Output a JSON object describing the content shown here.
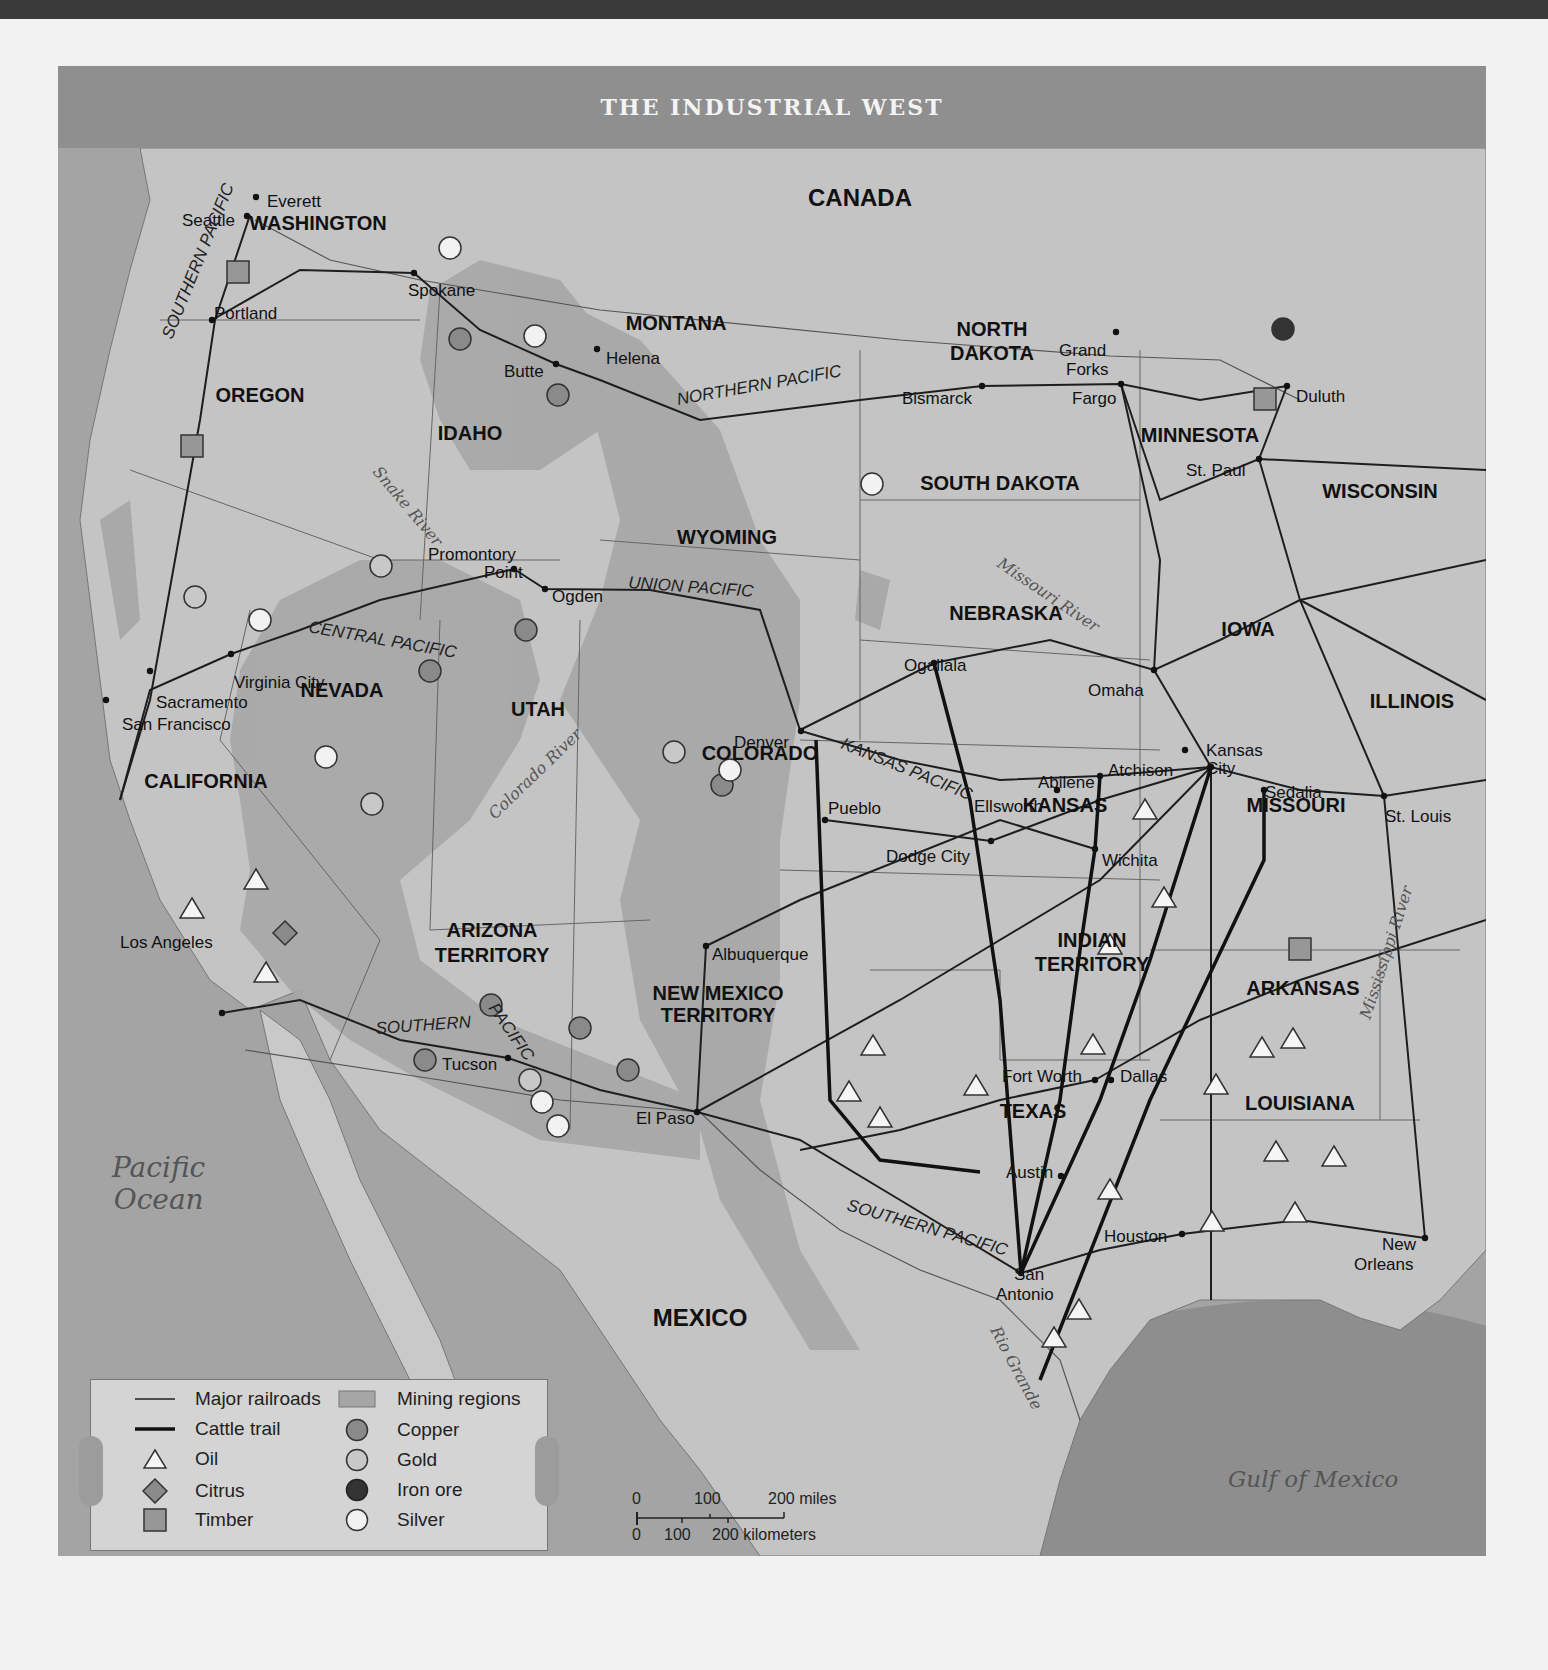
{
  "map": {
    "title": "THE INDUSTRIAL WEST",
    "countries": [
      "CANADA",
      "MEXICO"
    ],
    "water_bodies": [
      "Pacific Ocean",
      "Gulf of Mexico"
    ],
    "states": [
      {
        "name": "WASHINGTON",
        "x": 318,
        "y": 230
      },
      {
        "name": "OREGON",
        "x": 260,
        "y": 402
      },
      {
        "name": "CALIFORNIA",
        "x": 206,
        "y": 788
      },
      {
        "name": "IDAHO",
        "x": 470,
        "y": 440
      },
      {
        "name": "NEVADA",
        "x": 342,
        "y": 697
      },
      {
        "name": "UTAH",
        "x": 538,
        "y": 716
      },
      {
        "name": "ARIZONA",
        "x": 492,
        "y": 937
      },
      {
        "name": "TERRITORY",
        "x": 492,
        "y": 962
      },
      {
        "name": "MONTANA",
        "x": 676,
        "y": 330
      },
      {
        "name": "WYOMING",
        "x": 727,
        "y": 544
      },
      {
        "name": "COLORADO",
        "x": 760,
        "y": 760
      },
      {
        "name": "NEW MEXICO",
        "x": 718,
        "y": 1000
      },
      {
        "name": "TERRITORY",
        "x": 718,
        "y": 1022
      },
      {
        "name": "NORTH",
        "x": 992,
        "y": 336
      },
      {
        "name": "DAKOTA",
        "x": 992,
        "y": 360
      },
      {
        "name": "SOUTH DAKOTA",
        "x": 1000,
        "y": 490
      },
      {
        "name": "NEBRASKA",
        "x": 1006,
        "y": 620
      },
      {
        "name": "KANSAS",
        "x": 1065,
        "y": 812
      },
      {
        "name": "INDIAN",
        "x": 1092,
        "y": 947
      },
      {
        "name": "TERRITORY",
        "x": 1092,
        "y": 971
      },
      {
        "name": "TEXAS",
        "x": 1033,
        "y": 1118
      },
      {
        "name": "MINNESOTA",
        "x": 1200,
        "y": 442
      },
      {
        "name": "WISCONSIN",
        "x": 1380,
        "y": 498
      },
      {
        "name": "IOWA",
        "x": 1248,
        "y": 636
      },
      {
        "name": "ILLINOIS",
        "x": 1412,
        "y": 708
      },
      {
        "name": "MISSOURI",
        "x": 1296,
        "y": 812
      },
      {
        "name": "ARKANSAS",
        "x": 1303,
        "y": 995
      },
      {
        "name": "LOUISIANA",
        "x": 1300,
        "y": 1110
      },
      {
        "name": "CANADA",
        "x": 860,
        "y": 206
      },
      {
        "name": "MEXICO",
        "x": 700,
        "y": 1326
      }
    ],
    "cities": [
      {
        "name": "Seattle",
        "lx": 182,
        "ly": 212,
        "dx": 247,
        "dy": 216
      },
      {
        "name": "Everett",
        "lx": 267,
        "ly": 193,
        "dx": 256,
        "dy": 197
      },
      {
        "name": "Portland",
        "lx": 214,
        "ly": 305,
        "dx": 212,
        "dy": 320
      },
      {
        "name": "Spokane",
        "lx": 408,
        "ly": 282,
        "dx": 414,
        "dy": 273
      },
      {
        "name": "Butte",
        "lx": 504,
        "ly": 363,
        "dx": 556,
        "dy": 364
      },
      {
        "name": "Helena",
        "lx": 606,
        "ly": 350,
        "dx": 597,
        "dy": 349
      },
      {
        "name": "Bismarck",
        "lx": 902,
        "ly": 390,
        "dx": 982,
        "dy": 386
      },
      {
        "name": "Grand",
        "lx": 1059,
        "ly": 342,
        "dx": 1116,
        "dy": 332
      },
      {
        "name": "Forks",
        "lx": 1066,
        "ly": 361,
        "dx": -1,
        "dy": -1
      },
      {
        "name": "Fargo",
        "lx": 1072,
        "ly": 390,
        "dx": 1121,
        "dy": 384
      },
      {
        "name": "Duluth",
        "lx": 1296,
        "ly": 388,
        "dx": 1287,
        "dy": 386
      },
      {
        "name": "St. Paul",
        "lx": 1186,
        "ly": 462,
        "dx": 1259,
        "dy": 459
      },
      {
        "name": "Promontory",
        "lx": 428,
        "ly": 546,
        "dx": -1,
        "dy": -1
      },
      {
        "name": "Point",
        "lx": 484,
        "ly": 564,
        "dx": 514,
        "dy": 569
      },
      {
        "name": "Ogden",
        "lx": 552,
        "ly": 588,
        "dx": 545,
        "dy": 589
      },
      {
        "name": "Virginia City",
        "lx": 234,
        "ly": 674,
        "dx": 231,
        "dy": 654
      },
      {
        "name": "Sacramento",
        "lx": 156,
        "ly": 694,
        "dx": 150,
        "dy": 671
      },
      {
        "name": "San Francisco",
        "lx": 122,
        "ly": 716,
        "dx": 106,
        "dy": 700
      },
      {
        "name": "Ogallala",
        "lx": 904,
        "ly": 657,
        "dx": 934,
        "dy": 663
      },
      {
        "name": "Omaha",
        "lx": 1088,
        "ly": 682,
        "dx": 1154,
        "dy": 670
      },
      {
        "name": "Denver",
        "lx": 734,
        "ly": 734,
        "dx": 801,
        "dy": 731
      },
      {
        "name": "Kansas",
        "lx": 1206,
        "ly": 742,
        "dx": -1,
        "dy": -1
      },
      {
        "name": "City",
        "lx": 1206,
        "ly": 760,
        "dx": 1211,
        "dy": 767
      },
      {
        "name": "Atchison",
        "lx": 1108,
        "ly": 762,
        "dx": 1185,
        "dy": 750
      },
      {
        "name": "Abilene",
        "lx": 1038,
        "ly": 774,
        "dx": 1100,
        "dy": 776
      },
      {
        "name": "Ellsworth",
        "lx": 974,
        "ly": 798,
        "dx": 1057,
        "dy": 790
      },
      {
        "name": "Sedalia",
        "lx": 1265,
        "ly": 784,
        "dx": 1264,
        "dy": 790
      },
      {
        "name": "St. Louis",
        "lx": 1385,
        "ly": 808,
        "dx": 1384,
        "dy": 796
      },
      {
        "name": "Pueblo",
        "lx": 828,
        "ly": 800,
        "dx": 825,
        "dy": 820
      },
      {
        "name": "Dodge City",
        "lx": 886,
        "ly": 848,
        "dx": 991,
        "dy": 841
      },
      {
        "name": "Wichita",
        "lx": 1102,
        "ly": 852,
        "dx": 1095,
        "dy": 849
      },
      {
        "name": "Albuquerque",
        "lx": 712,
        "ly": 946,
        "dx": 706,
        "dy": 946
      },
      {
        "name": "Los Angeles",
        "lx": 120,
        "ly": 934,
        "dx": 222,
        "dy": 1013
      },
      {
        "name": "Tucson",
        "lx": 442,
        "ly": 1056,
        "dx": 508,
        "dy": 1058
      },
      {
        "name": "El Paso",
        "lx": 636,
        "ly": 1110,
        "dx": 697,
        "dy": 1112
      },
      {
        "name": "Fort Worth",
        "lx": 1002,
        "ly": 1068,
        "dx": 1095,
        "dy": 1080
      },
      {
        "name": "Dallas",
        "lx": 1120,
        "ly": 1068,
        "dx": 1111,
        "dy": 1080
      },
      {
        "name": "Austin",
        "lx": 1006,
        "ly": 1164,
        "dx": 1061,
        "dy": 1176
      },
      {
        "name": "Houston",
        "lx": 1104,
        "ly": 1228,
        "dx": 1182,
        "dy": 1234
      },
      {
        "name": "San",
        "lx": 1014,
        "ly": 1266,
        "dx": 1021,
        "dy": 1273
      },
      {
        "name": "Antonio",
        "lx": 996,
        "ly": 1286,
        "dx": -1,
        "dy": -1
      },
      {
        "name": "New",
        "lx": 1382,
        "ly": 1236,
        "dx": 1425,
        "dy": 1238
      },
      {
        "name": "Orleans",
        "lx": 1354,
        "ly": 1256,
        "dx": -1,
        "dy": -1
      }
    ],
    "railroad_labels": [
      {
        "text": "SOUTHERN PACIFIC",
        "x": 172,
        "y": 340,
        "rot": -68
      },
      {
        "text": "NORTHERN PACIFIC",
        "x": 678,
        "y": 405,
        "rot": -10
      },
      {
        "text": "CENTRAL PACIFIC",
        "x": 308,
        "y": 632,
        "rot": 10
      },
      {
        "text": "UNION PACIFIC",
        "x": 628,
        "y": 588,
        "rot": 4
      },
      {
        "text": "KANSAS PACIFIC",
        "x": 840,
        "y": 748,
        "rot": 22
      },
      {
        "text": "SOUTHERN",
        "x": 376,
        "y": 1034,
        "rot": -4
      },
      {
        "text": "PACIFIC",
        "x": 488,
        "y": 1008,
        "rot": 55
      },
      {
        "text": "SOUTHERN PACIFIC",
        "x": 846,
        "y": 1210,
        "rot": 16
      }
    ],
    "river_labels": [
      {
        "text": "Snake River",
        "x": 372,
        "y": 472,
        "rot": 50
      },
      {
        "text": "Missouri River",
        "x": 996,
        "y": 566,
        "rot": 34
      },
      {
        "text": "Colorado River",
        "x": 495,
        "y": 820,
        "rot": -44
      },
      {
        "text": "Mississippi River",
        "x": 1370,
        "y": 1020,
        "rot": -72
      },
      {
        "text": "Rio Grande",
        "x": 990,
        "y": 1330,
        "rot": 62
      }
    ]
  },
  "resources": {
    "copper": [
      [
        460,
        339
      ],
      [
        558,
        395
      ],
      [
        430,
        671
      ],
      [
        526,
        630
      ],
      [
        722,
        785
      ],
      [
        491,
        1005
      ],
      [
        580,
        1028
      ],
      [
        425,
        1060
      ],
      [
        628,
        1070
      ]
    ],
    "gold": [
      [
        195,
        597
      ],
      [
        372,
        804
      ],
      [
        674,
        752
      ],
      [
        381,
        566
      ],
      [
        530,
        1080
      ]
    ],
    "silver": [
      [
        450,
        248
      ],
      [
        535,
        336
      ],
      [
        872,
        484
      ],
      [
        260,
        620
      ],
      [
        326,
        757
      ],
      [
        730,
        770
      ],
      [
        542,
        1102
      ],
      [
        558,
        1126
      ]
    ],
    "iron_ore": [
      [
        1283,
        329
      ]
    ],
    "timber": [
      [
        238,
        272
      ],
      [
        192,
        446
      ],
      [
        1265,
        399
      ],
      [
        1300,
        949
      ]
    ],
    "citrus": [
      [
        285,
        933
      ]
    ],
    "oil": [
      [
        192,
        909
      ],
      [
        256,
        880
      ],
      [
        266,
        973
      ],
      [
        1145,
        810
      ],
      [
        1164,
        898
      ],
      [
        1110,
        945
      ],
      [
        1093,
        1045
      ],
      [
        873,
        1046
      ],
      [
        849,
        1092
      ],
      [
        880,
        1118
      ],
      [
        976,
        1086
      ],
      [
        1216,
        1085
      ],
      [
        1262,
        1048
      ],
      [
        1293,
        1039
      ],
      [
        1276,
        1152
      ],
      [
        1334,
        1157
      ],
      [
        1295,
        1213
      ],
      [
        1212,
        1222
      ],
      [
        1110,
        1190
      ],
      [
        1079,
        1310
      ],
      [
        1054,
        1338
      ]
    ]
  },
  "legend": {
    "items": [
      {
        "symbol": "line-thin",
        "label": "Major railroads"
      },
      {
        "symbol": "line-thick",
        "label": "Cattle trail"
      },
      {
        "symbol": "triangle",
        "label": "Oil"
      },
      {
        "symbol": "diamond",
        "label": "Citrus"
      },
      {
        "symbol": "square",
        "label": "Timber"
      },
      {
        "symbol": "rect",
        "label": "Mining regions"
      },
      {
        "symbol": "circle-copper",
        "label": "Copper"
      },
      {
        "symbol": "circle-gold",
        "label": "Gold"
      },
      {
        "symbol": "circle-iron",
        "label": "Iron ore"
      },
      {
        "symbol": "circle-silver",
        "label": "Silver"
      }
    ]
  },
  "scale": {
    "miles_ticks": [
      "0",
      "100",
      "200 miles"
    ],
    "km_ticks": [
      "0",
      "100",
      "200 kilometers"
    ]
  },
  "colors": {
    "land": "#c3c3c3",
    "ocean": "#a2a2a2",
    "mining": "#a6a6a6",
    "copper": "#8a8a8a",
    "gold": "#c8c8c8",
    "iron_ore": "#333333",
    "silver": "#f2f2f2",
    "timber": "#979797",
    "title_bg": "#8f8f8f"
  }
}
